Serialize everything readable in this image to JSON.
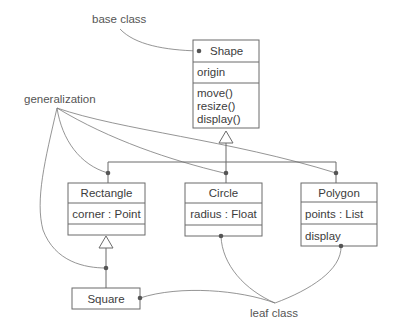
{
  "diagram": {
    "type": "UML class diagram",
    "annotations": {
      "base_class": "base class",
      "generalization": "generalization",
      "leaf_class": "leaf class"
    },
    "classes": {
      "shape": {
        "name": "Shape",
        "attributes": [
          "origin"
        ],
        "operations": [
          "move()",
          "resize()",
          "display()"
        ]
      },
      "rectangle": {
        "name": "Rectangle",
        "attributes": [
          "corner : Point"
        ],
        "operations": []
      },
      "circle": {
        "name": "Circle",
        "attributes": [
          "radius : Float"
        ],
        "operations": []
      },
      "polygon": {
        "name": "Polygon",
        "attributes": [
          "points : List"
        ],
        "operations": [
          "display"
        ]
      },
      "square": {
        "name": "Square",
        "attributes": [],
        "operations": []
      }
    },
    "relationships": [
      {
        "type": "generalization",
        "child": "Rectangle",
        "parent": "Shape"
      },
      {
        "type": "generalization",
        "child": "Circle",
        "parent": "Shape"
      },
      {
        "type": "generalization",
        "child": "Polygon",
        "parent": "Shape"
      },
      {
        "type": "generalization",
        "child": "Square",
        "parent": "Rectangle"
      }
    ],
    "colors": {
      "line": "#6b6b6b",
      "text": "#3c3c3c",
      "dot": "#555555",
      "background": "#ffffff"
    }
  }
}
